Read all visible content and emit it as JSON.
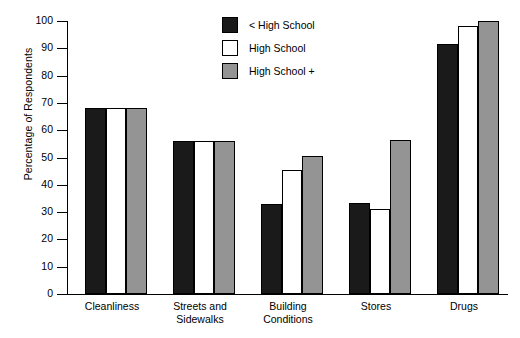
{
  "chart_data": {
    "type": "bar",
    "title": "",
    "xlabel": "",
    "ylabel": "Percentage of Respondents",
    "ylim": [
      0,
      100
    ],
    "ytick_step": 10,
    "yticks": [
      100,
      90,
      80,
      70,
      60,
      50,
      40,
      30,
      20,
      10,
      0
    ],
    "grid": false,
    "legend_position": "top-center",
    "categories": [
      "Cleanliness",
      "Streets and\nSidewalks",
      "Building\nConditions",
      "Stores",
      "Drugs"
    ],
    "series": [
      {
        "name": "< High School",
        "color": "#1a1a1a",
        "values": [
          68,
          56,
          33,
          33.5,
          91.5
        ]
      },
      {
        "name": "High School",
        "color": "#ffffff",
        "values": [
          68,
          56,
          45.5,
          31,
          98
        ]
      },
      {
        "name": "High School +",
        "color": "#949494",
        "values": [
          68,
          56,
          50.5,
          56.5,
          100
        ]
      }
    ]
  }
}
